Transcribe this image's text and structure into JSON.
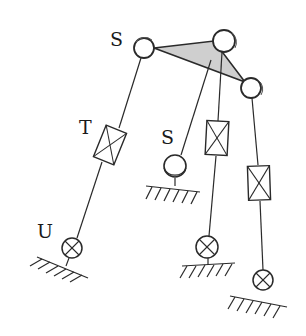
{
  "diagram": {
    "type": "kinematic mechanism schematic",
    "labels": {
      "top_joint": "S",
      "middle_joint": "S",
      "prismatic": "T",
      "universal": "U"
    },
    "colors": {
      "stroke": "#2a2a2a",
      "platform_fill": "#cfcfcf",
      "background": "#ffffff"
    },
    "components": [
      {
        "id": "platform",
        "kind": "triangle",
        "label": ""
      },
      {
        "id": "spherical-joint-top-left",
        "kind": "spherical-joint",
        "label": "S"
      },
      {
        "id": "spherical-joint-top-right",
        "kind": "spherical-joint",
        "label": ""
      },
      {
        "id": "spherical-joint-right",
        "kind": "spherical-joint",
        "label": ""
      },
      {
        "id": "prismatic-joint-left",
        "kind": "prismatic-joint",
        "label": "T"
      },
      {
        "id": "prismatic-joint-middle",
        "kind": "prismatic-joint",
        "label": ""
      },
      {
        "id": "prismatic-joint-right",
        "kind": "prismatic-joint",
        "label": ""
      },
      {
        "id": "spherical-joint-middle-base",
        "kind": "spherical-joint",
        "label": "S"
      },
      {
        "id": "universal-joint-left",
        "kind": "universal-joint",
        "label": "U"
      },
      {
        "id": "universal-joint-middle",
        "kind": "universal-joint",
        "label": ""
      },
      {
        "id": "universal-joint-right",
        "kind": "universal-joint",
        "label": ""
      }
    ]
  }
}
